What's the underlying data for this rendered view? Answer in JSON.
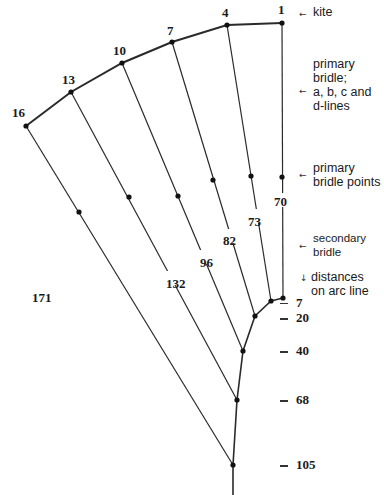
{
  "diagram": {
    "kite_points": [
      {
        "label": "16",
        "x": 26,
        "y": 126
      },
      {
        "label": "13",
        "x": 71,
        "y": 92
      },
      {
        "label": "10",
        "x": 122,
        "y": 63
      },
      {
        "label": "7",
        "x": 172,
        "y": 42
      },
      {
        "label": "4",
        "x": 227,
        "y": 25
      },
      {
        "label": "1",
        "x": 282,
        "y": 23
      }
    ],
    "line_lengths": [
      "171",
      "132",
      "96",
      "82",
      "73",
      "70"
    ],
    "legend": {
      "kite": "kite",
      "primary_bridle": "primary\nbridle;\na, b, c and\nd-lines",
      "primary_bridle_points": "primary\nbridle points",
      "secondary_bridle": "secondary\nbridle",
      "distances": "distances\non arc line"
    },
    "arc_distances": [
      "7",
      "20",
      "40",
      "68",
      "105"
    ],
    "arrows": {
      "left": "←",
      "down": "↓"
    }
  }
}
